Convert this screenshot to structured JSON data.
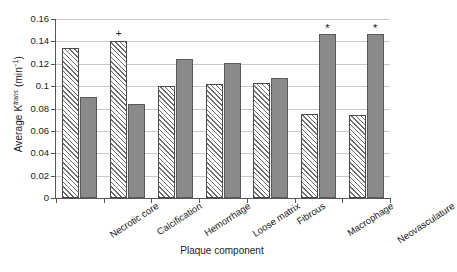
{
  "chart_data": {
    "type": "bar",
    "title": "",
    "xlabel": "Plaque component",
    "ylabel": "Average K",
    "ylabel_sup": "trans",
    "ylabel_units": "(min",
    "ylabel_units_sup": "−1",
    "ylabel_units_close": ")",
    "ylabel_full": "Average K^trans (min^-1)",
    "categories": [
      "Necrotic core",
      "Calcification",
      "Hemorrhage",
      "Loose matrix",
      "Fibrous",
      "Macrophage",
      "Neovasculature"
    ],
    "series": [
      {
        "name": "absent",
        "style": "hatched",
        "values": [
          0.134,
          0.14,
          0.1,
          0.102,
          0.103,
          0.075,
          0.074
        ]
      },
      {
        "name": "present",
        "style": "solid-gray",
        "values": [
          0.09,
          0.084,
          0.124,
          0.121,
          0.107,
          0.147,
          0.147
        ]
      }
    ],
    "annotations": [
      {
        "category": "Calcification",
        "series": "absent",
        "symbol": "+"
      },
      {
        "category": "Macrophage",
        "series": "present",
        "symbol": "*"
      },
      {
        "category": "Neovasculature",
        "series": "present",
        "symbol": "*"
      }
    ],
    "ylim": [
      0,
      0.16
    ],
    "yticks": [
      0,
      0.02,
      0.04,
      0.06,
      0.08,
      0.1,
      0.12,
      0.14,
      0.16
    ],
    "ytick_labels": [
      "0",
      "0.02",
      "0.04",
      "0.06",
      "0.08",
      "0.1",
      "0.12",
      "0.14",
      "0.16"
    ],
    "grid": true,
    "grid_axis": "y",
    "legend": "none",
    "colors": {
      "hatch_line": "#6e6e6e",
      "hatch_bg": "#ffffff",
      "solid_fill": "#8a8a8a",
      "bar_border": "#4a4a4a",
      "gridline": "#c9c9c9",
      "axis": "#555555",
      "text": "#1a1a1a"
    }
  }
}
